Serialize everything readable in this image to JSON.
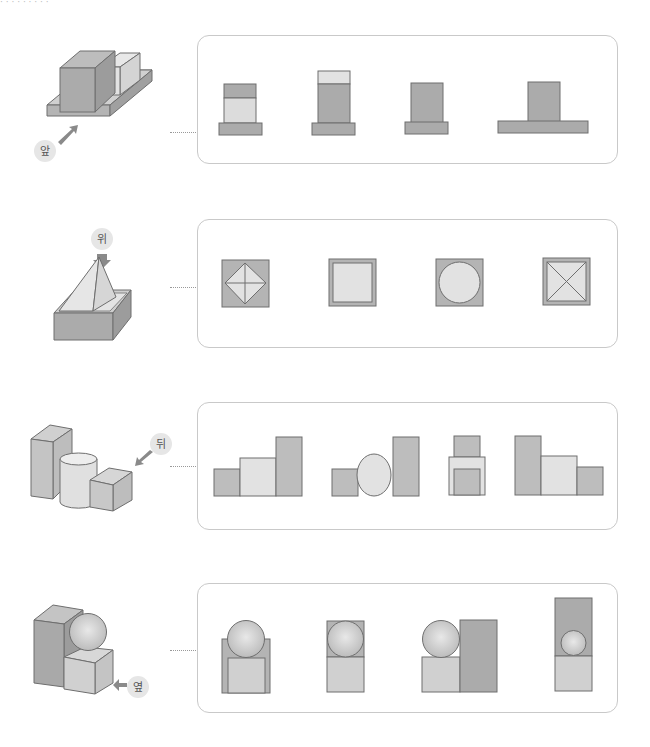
{
  "header": {
    "partial_text": "· · · · · · · · ·"
  },
  "colors": {
    "dark_face": "#a9a9a9",
    "mid_face": "#bdbdbd",
    "light_face": "#dcdcdc",
    "outline": "#6e6e6e",
    "panel_border": "#c9c9c9",
    "label_bubble": "#e6e6e6",
    "arrow": "#8a8a8a"
  },
  "rows": [
    {
      "id": "front",
      "direction_label": "앞",
      "object": "two-boxes-on-base",
      "options": [
        "option-1",
        "option-2",
        "option-3",
        "option-4"
      ]
    },
    {
      "id": "top",
      "direction_label": "위",
      "object": "pyramid-in-box",
      "options": [
        "diamond-in-square",
        "double-square",
        "circle-in-square",
        "x-in-square"
      ]
    },
    {
      "id": "back",
      "direction_label": "뒤",
      "object": "prism-cylinder-cube",
      "options": [
        "ascending-blocks",
        "block-circle-tall",
        "stacked-blocks",
        "descending-blocks"
      ]
    },
    {
      "id": "side",
      "direction_label": "옆",
      "object": "prism-sphere-cube",
      "options": [
        "sphere-on-frame",
        "sphere-in-box",
        "sphere-beside-tall",
        "small-sphere-in-tall"
      ]
    }
  ]
}
